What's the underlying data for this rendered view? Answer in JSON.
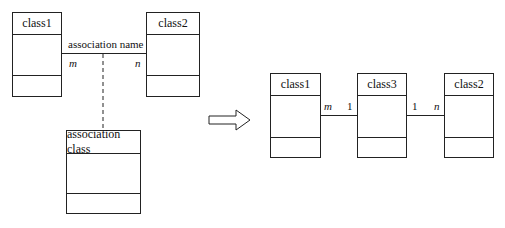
{
  "left_diagram": {
    "class1": {
      "name": "class1"
    },
    "class2": {
      "name": "class2"
    },
    "association": {
      "name": "association name",
      "mult_left": "m",
      "mult_right": "n"
    },
    "association_class": {
      "name": "association class"
    }
  },
  "transform_arrow": {
    "icon": "hollow-right-arrow"
  },
  "right_diagram": {
    "class1": {
      "name": "class1"
    },
    "class3": {
      "name": "class3"
    },
    "class2": {
      "name": "class2"
    },
    "link1": {
      "mult_left": "m",
      "mult_right": "1"
    },
    "link2": {
      "mult_left": "1",
      "mult_right": "n"
    }
  }
}
